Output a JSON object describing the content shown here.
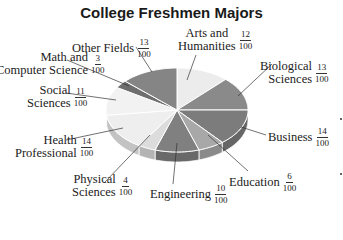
{
  "chart_data": {
    "type": "pie",
    "style": "3d",
    "title": "College Freshmen Majors",
    "categories": [
      "Arts and Humanities",
      "Biological Sciences",
      "Business",
      "Education",
      "Engineering",
      "Physical Sciences",
      "Health Professional",
      "Social Sciences",
      "Math and Computer Science",
      "Other Fields"
    ],
    "values": [
      12,
      13,
      14,
      6,
      10,
      4,
      14,
      11,
      3,
      13
    ],
    "denominator": 100,
    "labels": [
      {
        "name": "Arts and Humanities",
        "line1": "Arts and",
        "line2": "Humanities",
        "num": "12",
        "den": "100",
        "color": "#ececec"
      },
      {
        "name": "Biological Sciences",
        "line1": "Biological",
        "line2": "Sciences",
        "num": "13",
        "den": "100",
        "color": "#8a8a8a"
      },
      {
        "name": "Business",
        "line1": "Business",
        "line2": "",
        "num": "14",
        "den": "100",
        "color": "#7c7c7c"
      },
      {
        "name": "Education",
        "line1": "Education",
        "line2": "",
        "num": "6",
        "den": "100",
        "color": "#a8a8a8"
      },
      {
        "name": "Engineering",
        "line1": "Engineering",
        "line2": "",
        "num": "10",
        "den": "100",
        "color": "#808080"
      },
      {
        "name": "Physical Sciences",
        "line1": "Physical",
        "line2": "Sciences",
        "num": "4",
        "den": "100",
        "color": "#dcdcdc"
      },
      {
        "name": "Health Professional",
        "line1": "Health",
        "line2": "Professional",
        "num": "14",
        "den": "100",
        "color": "#eeeeee"
      },
      {
        "name": "Social Sciences",
        "line1": "Social",
        "line2": "Sciences",
        "num": "11",
        "den": "100",
        "color": "#f2f2f2"
      },
      {
        "name": "Math and Computer Science",
        "line1": "Math and",
        "line2": "Computer Science",
        "num": "3",
        "den": "100",
        "color": "#6e6e6e"
      },
      {
        "name": "Other Fields",
        "line1": "Other Fields",
        "line2": "",
        "num": "13",
        "den": "100",
        "color": "#858585"
      }
    ],
    "legend": "none (leader-line labels)"
  }
}
